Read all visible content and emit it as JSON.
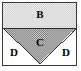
{
  "figure": {
    "width": 81,
    "height": 71,
    "background_color": "#ffffff",
    "frame": {
      "name": "outer-rectangle",
      "border_color": "#3a3a3a",
      "fill_color": "#ffffff",
      "x": 2,
      "y": 2,
      "width": 75,
      "height": 64
    },
    "regions": [
      {
        "id": "B",
        "label": "B",
        "shape": "rectangle",
        "description": "upper band of the rectangle above the triangle base",
        "fill": "light-checker-hatch",
        "fill_color": "#c9c9c9",
        "label_x": 40,
        "label_y": 14
      },
      {
        "id": "C",
        "label": "C",
        "shape": "triangle",
        "description": "downward pointing triangle inscribed in lower part of rectangle",
        "fill": "dark-checker-hatch",
        "fill_color": "#9a9a9a",
        "label_x": 40,
        "label_y": 42,
        "vertices": [
          [
            3,
            28
          ],
          [
            78,
            28
          ],
          [
            40,
            65
          ]
        ]
      },
      {
        "id": "D-left",
        "label": "D",
        "shape": "triangle",
        "description": "unshaded bottom-left corner triangle",
        "fill": "none",
        "fill_color": "#ffffff",
        "label_x": 14,
        "label_y": 52
      },
      {
        "id": "D-right",
        "label": "D",
        "shape": "triangle",
        "description": "unshaded bottom-right corner triangle",
        "fill": "none",
        "fill_color": "#ffffff",
        "label_x": 66,
        "label_y": 52
      }
    ],
    "separator_line": {
      "name": "triangle-base-line",
      "color": "#2e2e2e",
      "x1": 3,
      "y1": 28,
      "x2": 78,
      "y2": 28
    },
    "labels": {
      "b": "B",
      "c": "C",
      "d_left": "D",
      "d_right": "D"
    },
    "colors": {
      "stroke": "#3a3a3a",
      "hatch_light": "#c9c9c9",
      "hatch_dark": "#8f8f8f",
      "text": "#000000",
      "paper": "#ffffff"
    }
  }
}
